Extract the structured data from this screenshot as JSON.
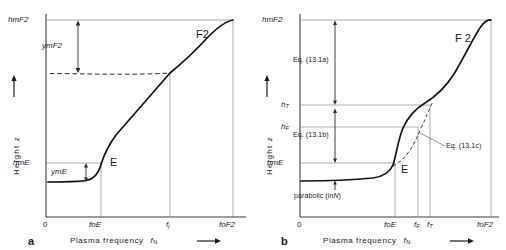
{
  "figure": {
    "type": "ionospheric-electron-density-profile",
    "axis_y_label": "Height  z",
    "axis_x_label": "Plasma frequency",
    "axis_x_symbol": "f",
    "axis_x_symbol_sub": "N",
    "zero_label": "0"
  },
  "panel_a": {
    "letter": "a",
    "y_ticks": [
      {
        "id": "hmF2",
        "label": "hmF2",
        "value_frac": 1.0
      },
      {
        "id": "hmE",
        "label": "hmE",
        "value_frac": 0.274
      }
    ],
    "x_ticks": [
      {
        "id": "zero",
        "label": "0",
        "value_frac": 0.0
      },
      {
        "id": "foE",
        "label": "foE",
        "value_frac": 0.268
      },
      {
        "id": "fj",
        "label_main": "f",
        "label_sub": "j",
        "value_frac": 0.62
      },
      {
        "id": "foF2",
        "label": "foF2",
        "value_frac": 0.945
      }
    ],
    "region_labels": [
      {
        "id": "F2",
        "label": "F2"
      },
      {
        "id": "E",
        "label": "E"
      }
    ],
    "measure_labels": [
      {
        "id": "ymF2",
        "label": "ymF2"
      },
      {
        "id": "ymE",
        "label": "ymE"
      }
    ]
  },
  "panel_b": {
    "letter": "b",
    "y_ticks": [
      {
        "id": "hmF2",
        "label": "hmF2",
        "value_frac": 1.0
      },
      {
        "id": "hT",
        "label_main": "h",
        "label_sub": "T",
        "value_frac": 0.574
      },
      {
        "id": "hF",
        "label_main": "h",
        "label_sub": "F",
        "value_frac": 0.49
      },
      {
        "id": "hmE",
        "label": "hmE",
        "value_frac": 0.274
      }
    ],
    "x_ticks": [
      {
        "id": "zero",
        "label": "0",
        "value_frac": 0.0
      },
      {
        "id": "foE",
        "label": "foE",
        "value_frac": 0.535
      },
      {
        "id": "fF",
        "label_main": "f",
        "label_sub": "F",
        "value_frac": 0.636
      },
      {
        "id": "fT",
        "label_main": "f",
        "label_sub": "T",
        "value_frac": 0.7
      },
      {
        "id": "foF2",
        "label": "foF2",
        "value_frac": 0.945
      }
    ],
    "region_labels": [
      {
        "id": "F2",
        "label": "F 2"
      },
      {
        "id": "E",
        "label": "E"
      }
    ],
    "annotations": [
      {
        "id": "eq-13-1a",
        "label": "Eq. (13.1a)"
      },
      {
        "id": "eq-13-1b",
        "label": "Eq. (13.1b)"
      },
      {
        "id": "eq-13-1c",
        "label": "Eq. (13.1c)"
      },
      {
        "id": "parabolic",
        "label_main": "parabolic (in",
        "label_italic": "N",
        "label_tail": ")"
      }
    ]
  }
}
